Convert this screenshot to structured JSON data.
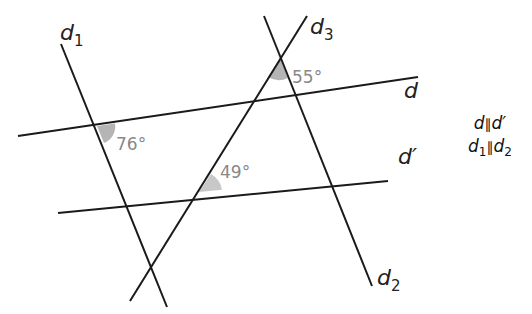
{
  "diagram": {
    "lines": [
      {
        "name": "d1",
        "label": "d",
        "sub": "1"
      },
      {
        "name": "d2",
        "label": "d",
        "sub": "2"
      },
      {
        "name": "d3",
        "label": "d",
        "sub": "3"
      },
      {
        "name": "d",
        "label": "d"
      },
      {
        "name": "d-prime",
        "label": "d′"
      }
    ],
    "angles": [
      {
        "name": "angle-76",
        "value": "76°"
      },
      {
        "name": "angle-55",
        "value": "55°"
      },
      {
        "name": "angle-49",
        "value": "49°"
      }
    ],
    "conditions": [
      "d // d′",
      "d1 // d2"
    ],
    "condition_parts": {
      "c1_a": "d",
      "c1_sym": "∥",
      "c1_b": "d′",
      "c2_a": "d",
      "c2_a_sub": "1",
      "c2_sym": "∥",
      "c2_b": "d",
      "c2_b_sub": "2"
    },
    "colors": {
      "line": "#1a1a1a",
      "angle_fill": "#b5b5b5",
      "angle_text": "#888888"
    }
  }
}
